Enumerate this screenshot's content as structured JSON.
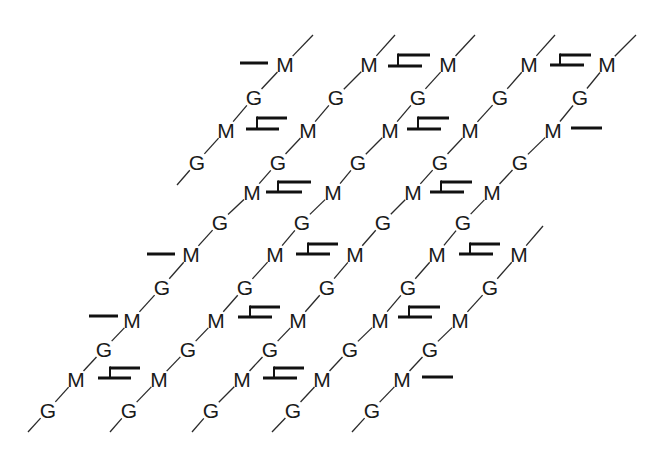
{
  "legend": {
    "G": "G",
    "M": "M"
  },
  "style": {
    "text_color": "#1a1a1a",
    "line_color": "#2a2a2a",
    "crosslink_color": "#111111",
    "background": "#ffffff"
  },
  "units": [
    {
      "label": "M",
      "x": 285,
      "y": 64
    },
    {
      "label": "M",
      "x": 369,
      "y": 64
    },
    {
      "label": "M",
      "x": 448,
      "y": 64
    },
    {
      "label": "M",
      "x": 529,
      "y": 64
    },
    {
      "label": "M",
      "x": 607,
      "y": 64
    },
    {
      "label": "G",
      "x": 254,
      "y": 97
    },
    {
      "label": "G",
      "x": 336,
      "y": 97
    },
    {
      "label": "G",
      "x": 418,
      "y": 97
    },
    {
      "label": "G",
      "x": 500,
      "y": 97
    },
    {
      "label": "G",
      "x": 580,
      "y": 97
    },
    {
      "label": "M",
      "x": 226,
      "y": 130
    },
    {
      "label": "M",
      "x": 308,
      "y": 130
    },
    {
      "label": "M",
      "x": 390,
      "y": 130
    },
    {
      "label": "M",
      "x": 470,
      "y": 130
    },
    {
      "label": "M",
      "x": 553,
      "y": 130
    },
    {
      "label": "G",
      "x": 197,
      "y": 162
    },
    {
      "label": "G",
      "x": 278,
      "y": 162
    },
    {
      "label": "G",
      "x": 358,
      "y": 162
    },
    {
      "label": "G",
      "x": 440,
      "y": 162
    },
    {
      "label": "G",
      "x": 520,
      "y": 162
    },
    {
      "label": "M",
      "x": 252,
      "y": 192
    },
    {
      "label": "M",
      "x": 333,
      "y": 192
    },
    {
      "label": "M",
      "x": 413,
      "y": 192
    },
    {
      "label": "M",
      "x": 492,
      "y": 192
    },
    {
      "label": "G",
      "x": 220,
      "y": 222
    },
    {
      "label": "G",
      "x": 302,
      "y": 222
    },
    {
      "label": "G",
      "x": 383,
      "y": 222
    },
    {
      "label": "G",
      "x": 463,
      "y": 222
    },
    {
      "label": "M",
      "x": 191,
      "y": 254
    },
    {
      "label": "M",
      "x": 275,
      "y": 254
    },
    {
      "label": "M",
      "x": 355,
      "y": 254
    },
    {
      "label": "M",
      "x": 437,
      "y": 254
    },
    {
      "label": "M",
      "x": 519,
      "y": 254
    },
    {
      "label": "G",
      "x": 162,
      "y": 287
    },
    {
      "label": "G",
      "x": 245,
      "y": 287
    },
    {
      "label": "G",
      "x": 327,
      "y": 287
    },
    {
      "label": "G",
      "x": 408,
      "y": 287
    },
    {
      "label": "G",
      "x": 490,
      "y": 287
    },
    {
      "label": "M",
      "x": 132,
      "y": 320
    },
    {
      "label": "M",
      "x": 216,
      "y": 320
    },
    {
      "label": "M",
      "x": 298,
      "y": 320
    },
    {
      "label": "M",
      "x": 380,
      "y": 320
    },
    {
      "label": "M",
      "x": 460,
      "y": 320
    },
    {
      "label": "G",
      "x": 104,
      "y": 349
    },
    {
      "label": "G",
      "x": 188,
      "y": 349
    },
    {
      "label": "G",
      "x": 270,
      "y": 349
    },
    {
      "label": "G",
      "x": 350,
      "y": 349
    },
    {
      "label": "G",
      "x": 430,
      "y": 349
    },
    {
      "label": "M",
      "x": 76,
      "y": 379
    },
    {
      "label": "M",
      "x": 159,
      "y": 379
    },
    {
      "label": "M",
      "x": 242,
      "y": 379
    },
    {
      "label": "M",
      "x": 322,
      "y": 379
    },
    {
      "label": "M",
      "x": 402,
      "y": 379
    },
    {
      "label": "G",
      "x": 48,
      "y": 410
    },
    {
      "label": "G",
      "x": 129,
      "y": 410
    },
    {
      "label": "G",
      "x": 211,
      "y": 410
    },
    {
      "label": "G",
      "x": 293,
      "y": 410
    },
    {
      "label": "G",
      "x": 372,
      "y": 410
    }
  ],
  "strands": [
    [
      [
        313,
        35
      ],
      [
        285,
        64
      ],
      [
        254,
        97
      ],
      [
        226,
        130
      ],
      [
        197,
        162
      ],
      [
        177,
        185
      ]
    ],
    [
      [
        395,
        35
      ],
      [
        369,
        64
      ],
      [
        336,
        97
      ],
      [
        308,
        130
      ],
      [
        278,
        162
      ],
      [
        252,
        192
      ],
      [
        220,
        222
      ],
      [
        191,
        254
      ],
      [
        162,
        287
      ],
      [
        132,
        320
      ],
      [
        104,
        349
      ],
      [
        76,
        379
      ],
      [
        48,
        410
      ],
      [
        28,
        432
      ]
    ],
    [
      [
        475,
        35
      ],
      [
        448,
        64
      ],
      [
        418,
        97
      ],
      [
        390,
        130
      ],
      [
        358,
        162
      ],
      [
        333,
        192
      ],
      [
        302,
        222
      ],
      [
        275,
        254
      ],
      [
        245,
        287
      ],
      [
        216,
        320
      ],
      [
        188,
        349
      ],
      [
        159,
        379
      ],
      [
        129,
        410
      ],
      [
        110,
        432
      ]
    ],
    [
      [
        555,
        35
      ],
      [
        529,
        64
      ],
      [
        500,
        97
      ],
      [
        470,
        130
      ],
      [
        440,
        162
      ],
      [
        413,
        192
      ],
      [
        383,
        222
      ],
      [
        355,
        254
      ],
      [
        327,
        287
      ],
      [
        298,
        320
      ],
      [
        270,
        349
      ],
      [
        242,
        379
      ],
      [
        211,
        410
      ],
      [
        192,
        432
      ]
    ],
    [
      [
        636,
        35
      ],
      [
        607,
        64
      ],
      [
        580,
        97
      ],
      [
        553,
        130
      ],
      [
        520,
        162
      ],
      [
        492,
        192
      ],
      [
        463,
        222
      ],
      [
        437,
        254
      ],
      [
        408,
        287
      ],
      [
        380,
        320
      ],
      [
        350,
        349
      ],
      [
        322,
        379
      ],
      [
        293,
        410
      ],
      [
        272,
        432
      ]
    ],
    [
      [
        543,
        226
      ],
      [
        519,
        254
      ],
      [
        490,
        287
      ],
      [
        460,
        320
      ],
      [
        430,
        349
      ],
      [
        402,
        379
      ],
      [
        372,
        410
      ],
      [
        352,
        432
      ]
    ]
  ],
  "crosslinks": [
    {
      "type": "single",
      "x1": 240,
      "x2": 268,
      "y": 63
    },
    {
      "type": "double",
      "x1": 388,
      "x2": 422,
      "ux": 398,
      "ux2": 430,
      "y": 66,
      "uy": 55
    },
    {
      "type": "double",
      "x1": 550,
      "x2": 584,
      "ux": 560,
      "ux2": 591,
      "y": 65,
      "uy": 55
    },
    {
      "type": "double",
      "x1": 246,
      "x2": 279,
      "ux": 257,
      "ux2": 287,
      "y": 129,
      "uy": 118
    },
    {
      "type": "double",
      "x1": 407,
      "x2": 441,
      "ux": 418,
      "ux2": 449,
      "y": 129,
      "uy": 118
    },
    {
      "type": "single",
      "x1": 571,
      "x2": 602,
      "y": 128
    },
    {
      "type": "double",
      "x1": 266,
      "x2": 302,
      "ux": 278,
      "ux2": 311,
      "y": 192,
      "uy": 182
    },
    {
      "type": "double",
      "x1": 430,
      "x2": 464,
      "ux": 441,
      "ux2": 472,
      "y": 192,
      "uy": 182
    },
    {
      "type": "single",
      "x1": 147,
      "x2": 175,
      "y": 254
    },
    {
      "type": "double",
      "x1": 296,
      "x2": 330,
      "ux": 308,
      "ux2": 338,
      "y": 254,
      "uy": 244
    },
    {
      "type": "double",
      "x1": 459,
      "x2": 493,
      "ux": 470,
      "ux2": 500,
      "y": 254,
      "uy": 244
    },
    {
      "type": "single",
      "x1": 89,
      "x2": 118,
      "y": 316
    },
    {
      "type": "double",
      "x1": 238,
      "x2": 272,
      "ux": 250,
      "ux2": 280,
      "y": 317,
      "uy": 307
    },
    {
      "type": "double",
      "x1": 398,
      "x2": 432,
      "ux": 409,
      "ux2": 440,
      "y": 317,
      "uy": 307
    },
    {
      "type": "double",
      "x1": 98,
      "x2": 131,
      "ux": 110,
      "ux2": 140,
      "y": 378,
      "uy": 368
    },
    {
      "type": "double",
      "x1": 263,
      "x2": 297,
      "ux": 274,
      "ux2": 304,
      "y": 378,
      "uy": 368
    },
    {
      "type": "single",
      "x1": 422,
      "x2": 453,
      "y": 377
    }
  ]
}
